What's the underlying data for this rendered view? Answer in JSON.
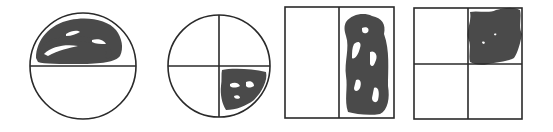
{
  "figure": {
    "colors": {
      "outline": "#2a2a2a",
      "shading": "#4a4a4a",
      "background": "#ffffff"
    },
    "shapes": [
      {
        "id": "circle-halves",
        "shape": "circle",
        "parts": 2,
        "shaded_parts": 1,
        "shaded_region": "top half",
        "fraction": "1/2"
      },
      {
        "id": "circle-quarters",
        "shape": "circle",
        "parts": 4,
        "shaded_parts": 1,
        "shaded_region": "bottom-right quarter",
        "fraction": "1/4"
      },
      {
        "id": "rectangle-halves",
        "shape": "rectangle",
        "parts": 2,
        "shaded_parts": 1,
        "shaded_region": "right half",
        "fraction": "1/2"
      },
      {
        "id": "square-quarters",
        "shape": "square",
        "parts": 4,
        "shaded_parts": 1,
        "shaded_region": "top-right quarter",
        "fraction": "1/4"
      }
    ]
  }
}
